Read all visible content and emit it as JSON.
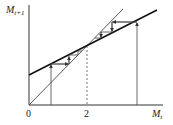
{
  "diagram": {
    "type": "cobweb",
    "y_axis_label": "M",
    "y_axis_subscript": "t+1",
    "x_axis_label": "M",
    "x_axis_subscript": "t",
    "origin_label": "0",
    "equilibrium_label": "2",
    "colors": {
      "line": "#222222",
      "guide": "#555555"
    }
  }
}
